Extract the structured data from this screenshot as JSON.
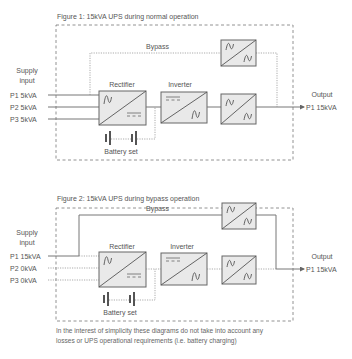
{
  "figure1": {
    "caption": "Figure 1: 15kVA UPS during normal operation",
    "supply_label_line1": "Supply",
    "supply_label_line2": "input",
    "inputs": [
      "P1 5kVA",
      "P2 5kVA",
      "P3 5kVA"
    ],
    "rectifier_label": "Rectifier",
    "inverter_label": "Inverter",
    "bypass_label": "Bypass",
    "battery_label": "Battery set",
    "output_label": "Output",
    "output_value": "P1 15kVA",
    "bypass_path_state": "inactive",
    "main_path_state": "active"
  },
  "figure2": {
    "caption": "Figure 2: 15kVA UPS during bypass operation",
    "supply_label_line1": "Supply",
    "supply_label_line2": "input",
    "inputs": [
      "P1 15kVA",
      "P2 0kVA",
      "P3 0kVA"
    ],
    "rectifier_label": "Rectifier",
    "inverter_label": "Inverter",
    "bypass_label": "Bypass",
    "battery_label": "Battery set",
    "output_label": "Output",
    "output_value": "P1 15kVA",
    "bypass_path_state": "active",
    "main_path_state": "inactive"
  },
  "footnote": {
    "line1": "In the interest of simplicity these diagrams do not take into account any",
    "line2": "losses or UPS operational requirements (i.e. battery charging)"
  },
  "icons": {
    "ac": "sine-wave",
    "dc": "dc-symbol",
    "battery": "battery-cell"
  },
  "colors": {
    "box_fill": "#e9e9e9",
    "line": "#777777",
    "text": "#555555"
  }
}
